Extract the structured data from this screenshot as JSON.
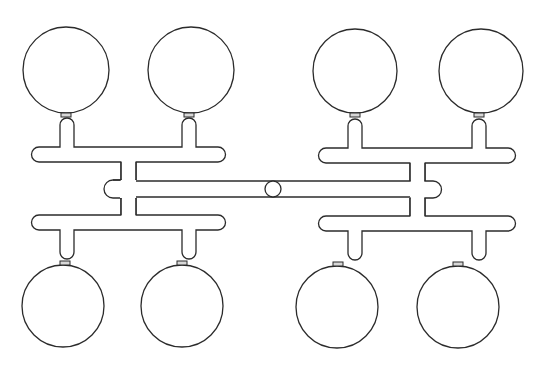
{
  "diagram": {
    "type": "model-kit sprue",
    "background": "#ffffff",
    "line_color": "#2b2b2b",
    "parts_count": 8,
    "parts": [
      {
        "id": "part-top-left-1",
        "cx": 66,
        "cy": 70,
        "r": 43
      },
      {
        "id": "part-top-left-2",
        "cx": 191,
        "cy": 70,
        "r": 43
      },
      {
        "id": "part-top-right-1",
        "cx": 355,
        "cy": 71,
        "r": 42
      },
      {
        "id": "part-top-right-2",
        "cx": 481,
        "cy": 71,
        "r": 42
      },
      {
        "id": "part-bottom-left-1",
        "cx": 63,
        "cy": 306,
        "r": 41
      },
      {
        "id": "part-bottom-left-2",
        "cx": 182,
        "cy": 306,
        "r": 41
      },
      {
        "id": "part-bottom-right-1",
        "cx": 337,
        "cy": 307,
        "r": 41
      },
      {
        "id": "part-bottom-right-2",
        "cx": 458,
        "cy": 307,
        "r": 41
      }
    ],
    "center_gate": {
      "cx": 273,
      "cy": 189,
      "r": 8
    }
  }
}
